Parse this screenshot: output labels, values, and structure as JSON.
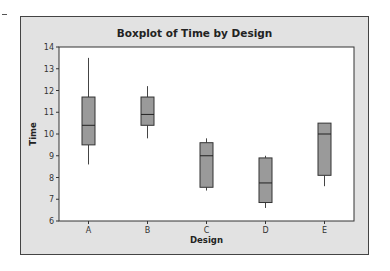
{
  "chart_data": {
    "type": "boxplot",
    "title": "Boxplot of Time by Design",
    "xlabel": "Design",
    "ylabel": "Time",
    "ylim": [
      6,
      14
    ],
    "yticks": [
      6,
      7,
      8,
      9,
      10,
      11,
      12,
      13,
      14
    ],
    "categories": [
      "A",
      "B",
      "C",
      "D",
      "E"
    ],
    "series": [
      {
        "name": "A",
        "min": 8.6,
        "q1": 9.5,
        "median": 10.4,
        "q3": 11.7,
        "max": 13.5
      },
      {
        "name": "B",
        "min": 9.8,
        "q1": 10.4,
        "median": 10.9,
        "q3": 11.7,
        "max": 12.2
      },
      {
        "name": "C",
        "min": 7.4,
        "q1": 7.55,
        "median": 9.0,
        "q3": 9.6,
        "max": 9.8
      },
      {
        "name": "D",
        "min": 6.6,
        "q1": 6.85,
        "median": 7.75,
        "q3": 8.9,
        "max": 9.0
      },
      {
        "name": "E",
        "min": 7.6,
        "q1": 8.1,
        "median": 10.0,
        "q3": 10.5,
        "max": 10.5
      }
    ],
    "grid": false,
    "legend": null,
    "colors": {
      "box_fill": "#9a9a9a",
      "frame_bg": "#e2e2e2",
      "plot_bg": "#ffffff"
    }
  }
}
